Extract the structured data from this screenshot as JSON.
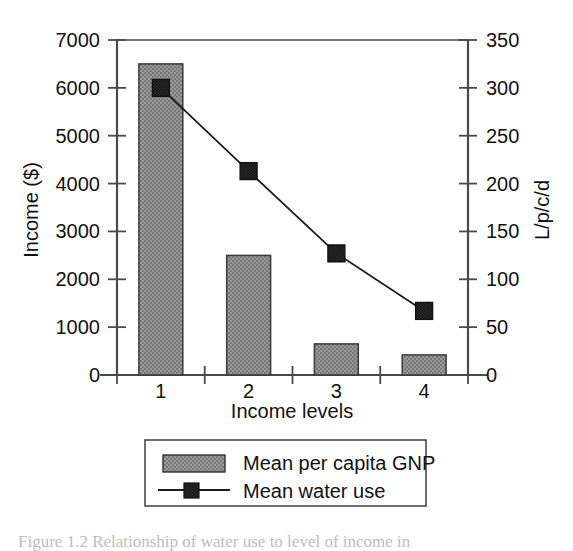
{
  "chart_data": {
    "type": "bar",
    "title": "",
    "xlabel": "Income levels",
    "ylabel": "Income ($)",
    "y2label": "L/p/c/d",
    "categories": [
      "1",
      "2",
      "3",
      "4"
    ],
    "ylim": [
      0,
      7000
    ],
    "y2lim": [
      0,
      350
    ],
    "yticks": [
      "0",
      "1000",
      "2000",
      "3000",
      "4000",
      "5000",
      "6000",
      "7000"
    ],
    "ytick_values": [
      0,
      1000,
      2000,
      3000,
      4000,
      5000,
      6000,
      7000
    ],
    "y2ticks": [
      "0",
      "50",
      "100",
      "150",
      "200",
      "250",
      "300",
      "350"
    ],
    "y2tick_values": [
      0,
      50,
      100,
      150,
      200,
      250,
      300,
      350
    ],
    "grid": false,
    "legend_position": "below-plot",
    "series": [
      {
        "name": "Mean per capita GNP",
        "kind": "bar",
        "axis": "left",
        "unit": "$",
        "values": [
          6500,
          2500,
          650,
          420
        ],
        "color": "#8f8f8f"
      },
      {
        "name": "Mean water use",
        "kind": "line",
        "axis": "right",
        "unit": "L/p/c/d",
        "values": [
          300,
          213,
          127,
          67
        ],
        "color": "#1a1a1a",
        "marker": "square"
      }
    ]
  },
  "legend": {
    "items": [
      {
        "label": "Mean per capita GNP",
        "type": "bar-swatch"
      },
      {
        "label": "Mean water use",
        "type": "line-marker-swatch"
      }
    ]
  },
  "caption": {
    "text": "Figure 1.2  Relationship of water use to level of income in",
    "visible": "partially-cropped"
  },
  "colors": {
    "bar_fill": "#8f8f8f",
    "bar_stroke": "#333333",
    "line": "#1a1a1a",
    "marker": "#2b2b2b",
    "axis": "#444444",
    "background": "#ffffff"
  }
}
